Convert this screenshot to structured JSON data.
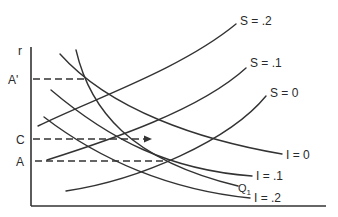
{
  "diagram": {
    "type": "economic-curve-diagram",
    "axes": {
      "y_label": "r",
      "x_label": ""
    },
    "y_markers": [
      {
        "id": "a-prime",
        "label": "A'"
      },
      {
        "id": "c",
        "label": "C"
      },
      {
        "id": "a",
        "label": "A"
      }
    ],
    "saving_curves": [
      {
        "id": "s-02",
        "label": "S = .2"
      },
      {
        "id": "s-01",
        "label": "S = .1"
      },
      {
        "id": "s-0",
        "label": "S = 0"
      }
    ],
    "investment_curves": [
      {
        "id": "i-0",
        "label": "I = 0"
      },
      {
        "id": "i-01",
        "label": "I = .1"
      },
      {
        "id": "i-02",
        "label": "I = .2"
      }
    ],
    "extra_curve": {
      "id": "q1",
      "label": "Q",
      "subscript": "1"
    },
    "colors": {
      "ink": "#333333",
      "background": "#ffffff"
    }
  }
}
